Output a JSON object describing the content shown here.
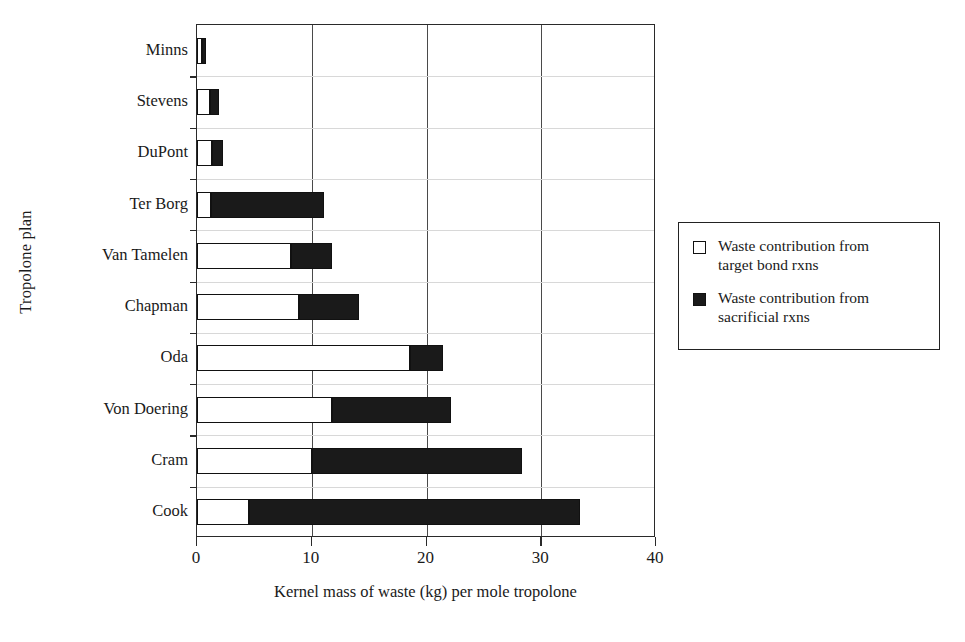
{
  "chart_data": {
    "type": "bar",
    "orientation": "horizontal",
    "stacked": true,
    "title": "",
    "xlabel": "Kernel mass of waste (kg) per mole tropolone",
    "ylabel": "Tropolone plan",
    "xlim": [
      0,
      40
    ],
    "xticks": [
      0,
      10,
      20,
      30,
      40
    ],
    "xticklabels": [
      "0",
      "10",
      "20",
      "30",
      "40"
    ],
    "grid": "vertical",
    "legend_position": "right",
    "categories": [
      "Minns",
      "Stevens",
      "DuPont",
      "Ter Borg",
      "Van Tamelen",
      "Chapman",
      "Oda",
      "Von Doering",
      "Cram",
      "Cook"
    ],
    "series": [
      {
        "name": "Waste contribution from target bond rxns",
        "color": "#ffffff",
        "values": [
          0.4,
          1.1,
          1.3,
          1.2,
          8.2,
          8.9,
          18.6,
          11.8,
          10.0,
          4.5
        ]
      },
      {
        "name": "Waste contribution from sacrificial rxns",
        "color": "#1a1a1a",
        "values": [
          0.4,
          0.8,
          1.0,
          9.9,
          3.6,
          5.2,
          2.8,
          10.3,
          18.3,
          28.9
        ]
      }
    ],
    "totals": [
      0.8,
      1.9,
      2.3,
      11.1,
      11.8,
      14.1,
      21.4,
      22.1,
      28.3,
      33.4
    ]
  },
  "legend": {
    "items": [
      {
        "swatch": "open-square",
        "line1": "Waste contribution from",
        "line2": "target bond rxns"
      },
      {
        "swatch": "filled-square",
        "line1": "Waste contribution from",
        "line2": "sacrificial rxns"
      }
    ]
  }
}
